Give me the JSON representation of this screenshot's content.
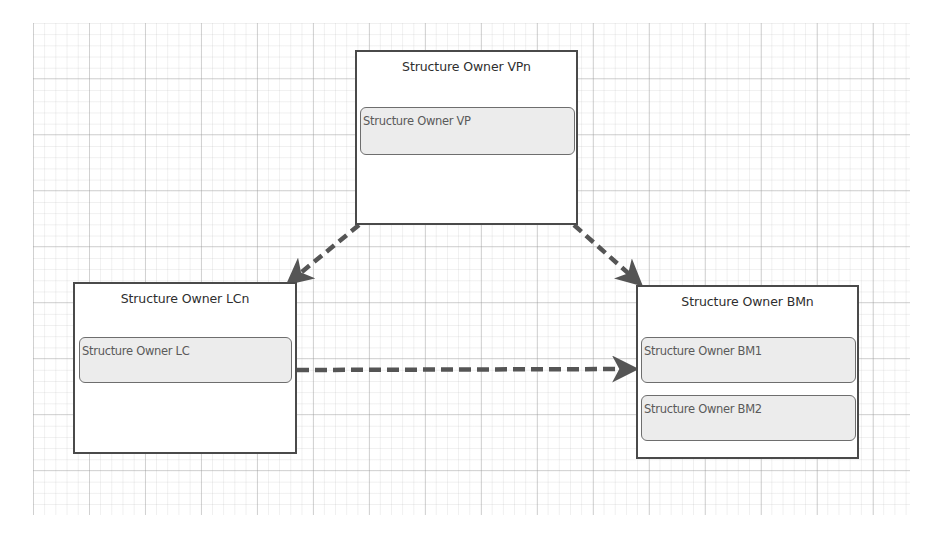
{
  "diagram": {
    "type": "org-structure",
    "canvas": {
      "grid": true,
      "grid_color": "#c8c8c8"
    },
    "colors": {
      "container_border": "#4a4a4a",
      "item_fill": "#ececec",
      "item_border": "#6e6e6e",
      "connector": "#555555",
      "title_text": "#2e2e2e",
      "item_text": "#5a5a5a"
    },
    "containers": [
      {
        "id": "vp",
        "title": "Structure Owner VPn",
        "items": [
          {
            "label": "Structure Owner VP"
          }
        ]
      },
      {
        "id": "lc",
        "title": "Structure Owner LCn",
        "items": [
          {
            "label": "Structure Owner LC"
          }
        ]
      },
      {
        "id": "bm",
        "title": "Structure Owner BMn",
        "items": [
          {
            "label": "Structure Owner BM1"
          },
          {
            "label": "Structure Owner BM2"
          }
        ]
      }
    ],
    "connectors": [
      {
        "from": "Structure Owner VPn",
        "to": "Structure Owner LCn",
        "style": "dashed",
        "arrow": "end"
      },
      {
        "from": "Structure Owner VPn",
        "to": "Structure Owner BMn",
        "style": "dashed",
        "arrow": "end"
      },
      {
        "from": "Structure Owner LCn",
        "to": "Structure Owner BM1",
        "style": "dashed",
        "arrow": "end"
      }
    ]
  }
}
